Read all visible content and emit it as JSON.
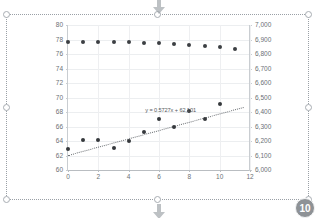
{
  "object": {
    "type": "embedded-chart",
    "selected": true,
    "badge_label": "10",
    "handle_count": 8
  },
  "overlay": {
    "top_arrow_icon": "arrow-down-icon",
    "bottom_arrow_icon": "arrow-down-icon"
  },
  "chart_data": {
    "type": "scatter",
    "title": "",
    "xlabel": "",
    "ylabel": "",
    "grid": true,
    "legend": "none",
    "xlim": [
      0,
      12
    ],
    "xticks": [
      "0",
      "2",
      "4",
      "6",
      "8",
      "10",
      "12"
    ],
    "xtick_values": [
      0,
      2,
      4,
      6,
      8,
      10,
      12
    ],
    "ylim": [
      60,
      80
    ],
    "yticks": [
      "60",
      "62",
      "64",
      "66",
      "68",
      "70",
      "72",
      "74",
      "76",
      "78",
      "80"
    ],
    "ytick_values": [
      60,
      62,
      64,
      66,
      68,
      70,
      72,
      74,
      76,
      78,
      80
    ],
    "y2lim": [
      6000,
      7000
    ],
    "y2ticks": [
      "6,000",
      "6,100",
      "6,200",
      "6,300",
      "6,400",
      "6,500",
      "6,600",
      "6,700",
      "6,800",
      "6,900",
      "7,000"
    ],
    "y2tick_values": [
      6000,
      6100,
      6200,
      6300,
      6400,
      6500,
      6600,
      6700,
      6800,
      6900,
      7000
    ],
    "x": [
      0,
      1,
      2,
      3,
      4,
      5,
      6,
      7,
      8,
      9,
      10,
      11
    ],
    "series": [
      {
        "name": "Series 1",
        "axis": "primary",
        "marker": "circle",
        "color": "#3c3f43",
        "values": [
          77.7,
          77.7,
          77.7,
          77.6,
          77.6,
          77.5,
          77.5,
          77.4,
          77.3,
          77.1,
          76.9,
          76.7
        ]
      },
      {
        "name": "Series 2",
        "axis": "primary",
        "marker": "circle",
        "color": "#35383c",
        "values": [
          62.9,
          64.1,
          64.1,
          63.0,
          64.0,
          65.2,
          67.0,
          66.0,
          68.1,
          67.0,
          69.1,
          null
        ]
      }
    ],
    "trendline": {
      "for_series": "Series 2",
      "type": "linear",
      "style": "dotted",
      "equation": "y = 0.5727x + 62,101",
      "slope": 0.5727,
      "intercept": 62.101,
      "x_start": 0,
      "x_end": 11.6
    }
  }
}
